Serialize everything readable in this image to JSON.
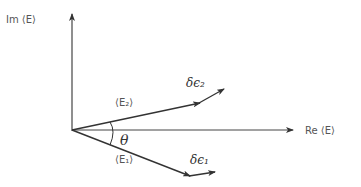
{
  "diagram": {
    "axes": {
      "y_label": "Im ⟨E⟩",
      "x_label": "Re ⟨E⟩"
    },
    "vectors": [
      {
        "name": "E2",
        "label": "⟨E₂⟩"
      },
      {
        "name": "E1",
        "label": "⟨E₁⟩"
      }
    ],
    "perturbations": [
      {
        "name": "delta-epsilon-2",
        "label": "δϵ₂"
      },
      {
        "name": "delta-epsilon-1",
        "label": "δϵ₁"
      }
    ],
    "angle_label": "θ",
    "colors": {
      "stroke": "#333333",
      "text": "#555555"
    }
  }
}
